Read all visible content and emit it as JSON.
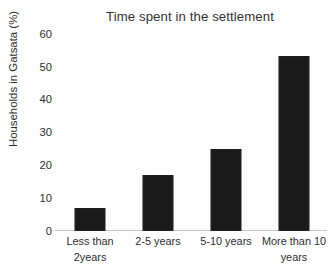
{
  "chart_data": {
    "type": "bar",
    "title": "Time spent in the settlement",
    "xlabel": "",
    "ylabel": "Households in Gatsata (%)",
    "categories": [
      "Less than 2years",
      "2-5 years",
      "5-10 years",
      "More than 10 years"
    ],
    "category_lines": [
      [
        "Less than",
        "2years"
      ],
      [
        "2-5 years",
        ""
      ],
      [
        "5-10 years",
        ""
      ],
      [
        "More than 10",
        "years"
      ]
    ],
    "values": [
      7,
      17,
      25,
      53
    ],
    "ylim": [
      0,
      60
    ],
    "yticks": [
      "60",
      "50",
      "40",
      "30",
      "20",
      "10",
      "0"
    ],
    "ytick_values": [
      60,
      50,
      40,
      30,
      20,
      10,
      0
    ],
    "grid": false,
    "legend": "none",
    "bar_color": "#1a1a1a",
    "background_color": "#ffffff",
    "axis_color": "#c9c9c9"
  }
}
